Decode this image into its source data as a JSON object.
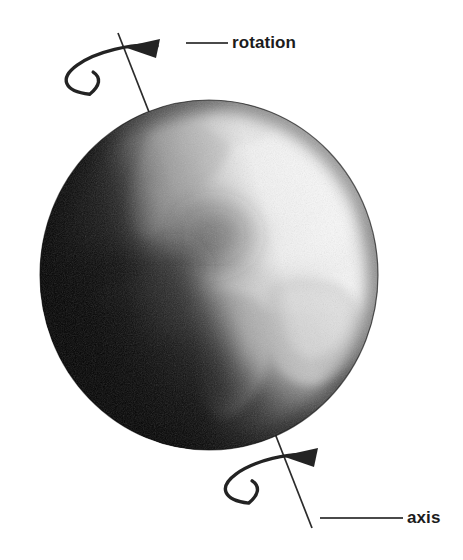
{
  "figure": {
    "background_color": "#ffffff",
    "width": 463,
    "height": 560
  },
  "globe": {
    "name": "earth-globe",
    "description": "Grayscale photographic Earth globe showing North America, South America and Africa with cloud cover; bright highlight toward the upper right and dark terminator on the left limb.",
    "center_x": 209,
    "center_y": 275,
    "radius_x": 169,
    "radius_y": 175,
    "highlight_color": "#ffffff",
    "shadow_color": "#050505",
    "midtone_color": "#9a9a9a"
  },
  "axis": {
    "name": "rotation-axis",
    "stroke_color": "#2b2b2b",
    "top_x": 118,
    "top_y": 33,
    "bottom_x": 312,
    "bottom_y": 528,
    "tilt_note": "tilted axis passing through the globe from upper-left to lower-right"
  },
  "labels": [
    {
      "id": "rotation",
      "text": "rotation",
      "text_x": 232,
      "text_y": 48,
      "leader_start_x": 186,
      "leader_end_x": 228,
      "leader_y": 43,
      "color": "#1c1c1c"
    },
    {
      "id": "axis",
      "text": "axis",
      "text_x": 407,
      "text_y": 523,
      "leader_start_x": 320,
      "leader_end_x": 403,
      "leader_y": 518,
      "color": "#1c1c1c"
    }
  ],
  "rotation_arrows": [
    {
      "id": "top-rotation-arrow",
      "name": "rotation-arrow-top",
      "center_x": 132,
      "center_y": 72,
      "radius_x": 58,
      "radius_y": 22,
      "rotation_deg": -12,
      "direction": "counterclockwise-viewed-from-above",
      "arrow_tip_x": 127,
      "arrow_tip_y": 46,
      "color": "#232323"
    },
    {
      "id": "bottom-rotation-arrow",
      "name": "rotation-arrow-bottom",
      "center_x": 290,
      "center_y": 481,
      "radius_x": 57,
      "radius_y": 22,
      "rotation_deg": -12,
      "direction": "counterclockwise-viewed-from-above",
      "arrow_tip_x": 285,
      "arrow_tip_y": 455,
      "color": "#232323"
    }
  ]
}
